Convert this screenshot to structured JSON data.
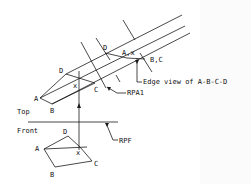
{
  "diagram": {
    "views": {
      "top_label": "Top",
      "front_label": "Front"
    },
    "points": {
      "top": {
        "A": "A",
        "B": "B",
        "C": "C",
        "D": "D",
        "x": "x"
      },
      "front": {
        "A": "A",
        "B": "B",
        "C": "C",
        "D": "D",
        "x": "x"
      },
      "aux": {
        "D": "D",
        "Ax": "A,x",
        "BC": "B,C"
      }
    },
    "annotations": {
      "edge_view": "Edge view of A-B-C-D",
      "rpa1": "RPA1",
      "rpf": "RPF"
    },
    "colors": {
      "line": "#1a1a1a",
      "background": "#ffffff"
    }
  }
}
